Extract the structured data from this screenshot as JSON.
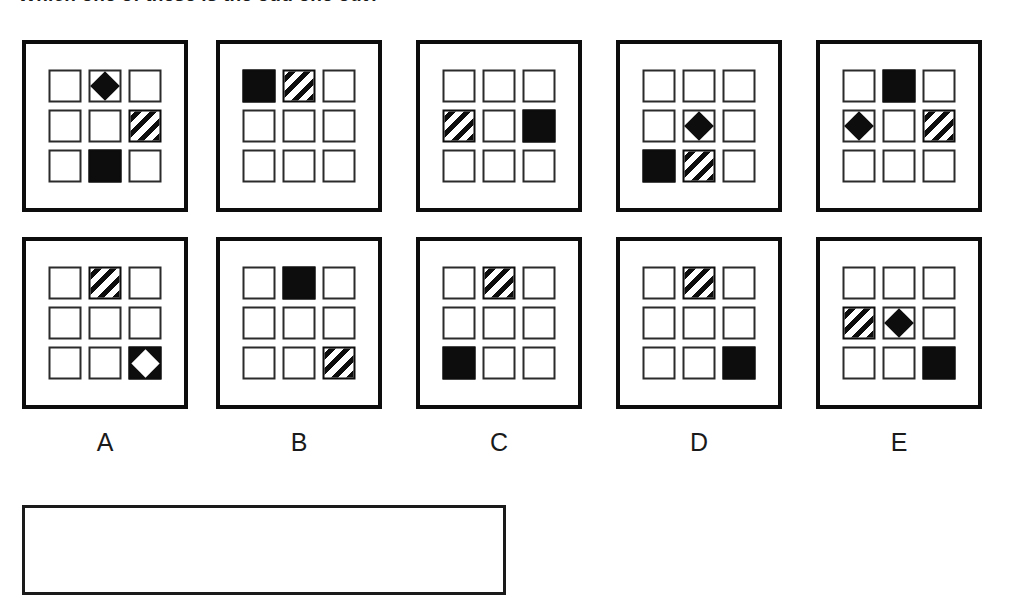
{
  "header": {
    "fragment_text": "Which one of these is the odd one out?"
  },
  "layout": {
    "rows": 2,
    "columns": 5,
    "grid_rows": 3,
    "grid_cols": 3,
    "panel_positions_x": [
      22,
      216,
      416,
      616,
      816
    ],
    "panel_positions_y": [
      40,
      237
    ]
  },
  "colors": {
    "ink": "#0d0d0d",
    "cell_outline": "#2b2b2b",
    "background": "#ffffff"
  },
  "legend": {
    "shape_types": [
      "empty",
      "filled",
      "striped",
      "diamond",
      "diamond-inverted"
    ]
  },
  "options": [
    {
      "label": "A"
    },
    {
      "label": "B"
    },
    {
      "label": "C"
    },
    {
      "label": "D"
    },
    {
      "label": "E"
    }
  ],
  "panels": [
    {
      "id": "top-A",
      "row": "top",
      "column": "A",
      "cells": [
        "empty",
        "diamond",
        "empty",
        "empty",
        "empty",
        "striped",
        "empty",
        "filled",
        "empty"
      ]
    },
    {
      "id": "top-B",
      "row": "top",
      "column": "B",
      "cells": [
        "filled",
        "striped",
        "empty",
        "empty",
        "empty",
        "empty",
        "empty",
        "empty",
        "empty"
      ]
    },
    {
      "id": "top-C",
      "row": "top",
      "column": "C",
      "cells": [
        "empty",
        "empty",
        "empty",
        "striped",
        "empty",
        "filled",
        "empty",
        "empty",
        "empty"
      ]
    },
    {
      "id": "top-D",
      "row": "top",
      "column": "D",
      "cells": [
        "empty",
        "empty",
        "empty",
        "empty",
        "diamond",
        "empty",
        "filled",
        "striped",
        "empty"
      ]
    },
    {
      "id": "top-E",
      "row": "top",
      "column": "E",
      "cells": [
        "empty",
        "filled",
        "empty",
        "diamond",
        "empty",
        "striped",
        "empty",
        "empty",
        "empty"
      ]
    },
    {
      "id": "bottom-A",
      "row": "bottom",
      "column": "A",
      "cells": [
        "empty",
        "striped",
        "empty",
        "empty",
        "empty",
        "empty",
        "empty",
        "empty",
        "diamond-inverted"
      ]
    },
    {
      "id": "bottom-B",
      "row": "bottom",
      "column": "B",
      "cells": [
        "empty",
        "filled",
        "empty",
        "empty",
        "empty",
        "empty",
        "empty",
        "empty",
        "striped"
      ]
    },
    {
      "id": "bottom-C",
      "row": "bottom",
      "column": "C",
      "cells": [
        "empty",
        "striped",
        "empty",
        "empty",
        "empty",
        "empty",
        "filled",
        "empty",
        "empty"
      ]
    },
    {
      "id": "bottom-D",
      "row": "bottom",
      "column": "D",
      "cells": [
        "empty",
        "striped",
        "empty",
        "empty",
        "empty",
        "empty",
        "empty",
        "empty",
        "filled"
      ]
    },
    {
      "id": "bottom-E",
      "row": "bottom",
      "column": "E",
      "cells": [
        "empty",
        "empty",
        "empty",
        "striped",
        "diamond",
        "empty",
        "empty",
        "empty",
        "filled"
      ]
    }
  ],
  "answer_box": {
    "label": ""
  }
}
